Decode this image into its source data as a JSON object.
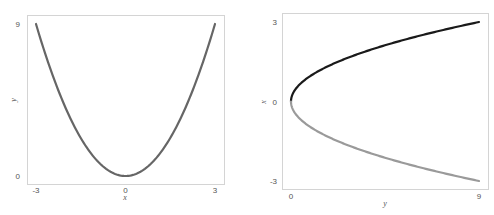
{
  "chart_data": [
    {
      "type": "line",
      "title": "",
      "xlabel": "x",
      "ylabel": "y",
      "xlim": [
        -3,
        3
      ],
      "ylim": [
        0,
        9
      ],
      "xticks": [
        -3,
        0,
        3
      ],
      "yticks": [
        0,
        9
      ],
      "xtick_labels": [
        "-3",
        "0",
        "3"
      ],
      "ytick_labels": [
        "0",
        "9"
      ],
      "grid": false,
      "legend": "none",
      "series": [
        {
          "name": "y = x^2",
          "color": "#666666",
          "x": [
            -3,
            -2.5,
            -2,
            -1.5,
            -1,
            -0.5,
            0,
            0.5,
            1,
            1.5,
            2,
            2.5,
            3
          ],
          "y": [
            9,
            6.25,
            4,
            2.25,
            1,
            0.25,
            0,
            0.25,
            1,
            2.25,
            4,
            6.25,
            9
          ]
        }
      ]
    },
    {
      "type": "line",
      "title": "",
      "xlabel": "y",
      "ylabel": "x",
      "xlim": [
        0,
        9
      ],
      "ylim": [
        -3,
        3
      ],
      "xticks": [
        0,
        9
      ],
      "yticks": [
        -3,
        0,
        3
      ],
      "xtick_labels": [
        "0",
        "9"
      ],
      "ytick_labels": [
        "-3",
        "0",
        "3"
      ],
      "grid": false,
      "legend": "none",
      "series": [
        {
          "name": "x = sqrt(y)",
          "color": "#1a1a1a",
          "x": [
            0,
            0.25,
            1,
            2.25,
            4,
            6.25,
            9
          ],
          "y": [
            0,
            0.5,
            1,
            1.5,
            2,
            2.5,
            3
          ]
        },
        {
          "name": "x = -sqrt(y)",
          "color": "#9a9a9a",
          "x": [
            0,
            0.25,
            1,
            2.25,
            4,
            6.25,
            9
          ],
          "y": [
            0,
            -0.5,
            -1,
            -1.5,
            -2,
            -2.5,
            -3
          ]
        }
      ]
    }
  ]
}
